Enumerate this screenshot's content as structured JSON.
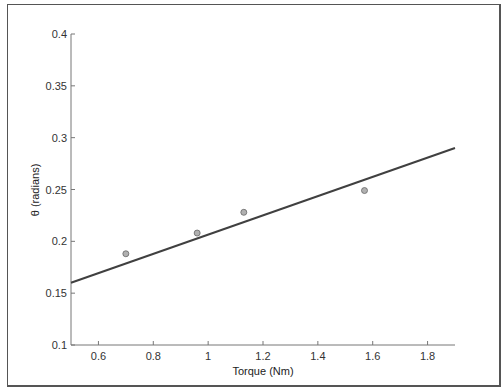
{
  "chart_data": {
    "type": "scatter",
    "title": "",
    "xlabel": "Torque (Nm)",
    "ylabel": "θ (radians)",
    "xlim": [
      0.5,
      1.9
    ],
    "ylim": [
      0.1,
      0.4
    ],
    "xticks": [
      "0.6",
      "0.8",
      "1",
      "1.2",
      "1.4",
      "1.6",
      "1.8"
    ],
    "yticks": [
      "0.1",
      "0.15",
      "0.2",
      "0.25",
      "0.3",
      "0.35",
      "0.4"
    ],
    "grid": false,
    "legend": null,
    "series": [
      {
        "name": "measured",
        "type": "scatter",
        "x": [
          0.7,
          0.96,
          1.13,
          1.57
        ],
        "y": [
          0.188,
          0.208,
          0.228,
          0.249
        ],
        "marker_color": "#b0b0b0"
      },
      {
        "name": "fit",
        "type": "line",
        "x": [
          0.5,
          1.9
        ],
        "y": [
          0.16,
          0.29
        ],
        "color": "#404040"
      }
    ]
  }
}
